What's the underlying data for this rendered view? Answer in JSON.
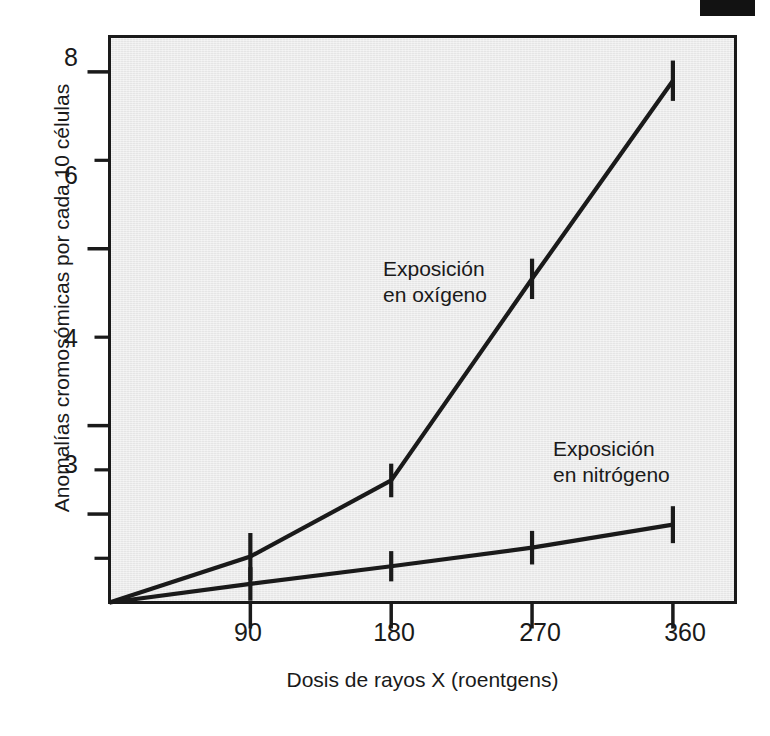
{
  "figure": {
    "background_color": "#ffffff",
    "panel_color": "#ebebeb",
    "ink_color": "#1a1a1a",
    "scan_artifact": "black-bar-top-right"
  },
  "chart_data": {
    "type": "line",
    "title": "",
    "xlabel": "Dosis de rayos X (roentgens)",
    "ylabel": "Anomalías cromosómicas por cada 10 células",
    "x": [
      0,
      90,
      180,
      270,
      360
    ],
    "xtick_labels": [
      "90",
      "180",
      "270",
      "360"
    ],
    "xtick_values": [
      90,
      180,
      270,
      360
    ],
    "xlim": [
      0,
      400
    ],
    "ytick_labels": [
      "8",
      "6",
      "4",
      "3"
    ],
    "ytick_values": [
      8,
      6,
      4,
      3
    ],
    "yminor_count": 4,
    "ylim": [
      2.0,
      8.4
    ],
    "grid": false,
    "legend_position": "inline-annotations",
    "error_bars": true,
    "series": [
      {
        "name": "Exposición en oxígeno",
        "label_line1": "Exposición",
        "label_line2": "en oxígeno",
        "values": [
          2.0,
          2.52,
          3.38,
          5.66,
          7.9
        ],
        "errors": [
          0.0,
          0.14,
          0.1,
          0.12,
          0.12
        ]
      },
      {
        "name": "Exposición en nitrógeno",
        "label_line1": "Exposición",
        "label_line2": "en nitrógeno",
        "values": [
          2.0,
          2.21,
          2.41,
          2.62,
          2.88
        ],
        "errors": [
          0.0,
          0.1,
          0.09,
          0.1,
          0.11
        ]
      }
    ]
  },
  "axes": {
    "y_ticks": [
      {
        "label": "8",
        "value": 8
      },
      {
        "label": "6",
        "value": 6
      },
      {
        "label": "4",
        "value": 4
      },
      {
        "label": "3",
        "value": 3
      }
    ],
    "x_ticks": [
      {
        "label": "90",
        "value": 90
      },
      {
        "label": "180",
        "value": 180
      },
      {
        "label": "270",
        "value": 270
      },
      {
        "label": "360",
        "value": 360
      }
    ]
  }
}
